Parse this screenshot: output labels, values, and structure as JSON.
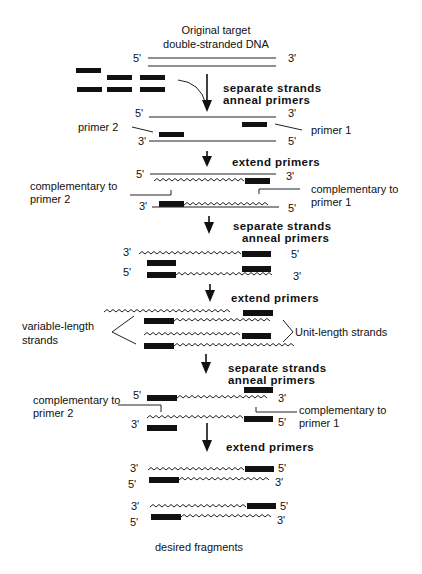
{
  "title": {
    "line1": "Original target",
    "line2": "double-stranded DNA"
  },
  "ends": {
    "five": "5'",
    "three": "3'"
  },
  "steps": {
    "s1_line1": "separate strands",
    "s1_line2": "anneal primers",
    "s2": "extend primers",
    "s3_line1": "separate strands",
    "s3_line2": "anneal primers",
    "s4": "extend primers",
    "s5_line1": "separate strands",
    "s5_line2": "anneal primers",
    "s6": "extend primers"
  },
  "labels": {
    "primer1": "primer 1",
    "primer2": "primer 2",
    "comp_p2_line1": "complementary to",
    "comp_p2_line2": "primer 2",
    "comp_p1_line1": "complementary to",
    "comp_p1_line2": "primer 1",
    "variable_line1": "variable-length",
    "variable_line2": "strands",
    "unit_length": "Unit-length strands",
    "comp2_p2_line1": "complementary to",
    "comp2_p2_line2": "primer 2",
    "comp2_p1_line1": "complementary to",
    "comp2_p1_line2": "primer 1",
    "desired": "desired fragments"
  },
  "colors": {
    "ink": "#111111",
    "background": "#ffffff"
  }
}
